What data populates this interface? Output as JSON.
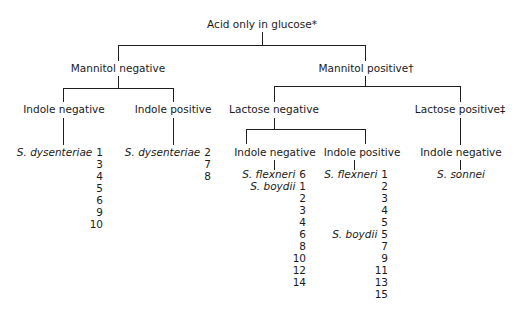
{
  "root": "Acid only in glucose*",
  "level1": {
    "left": "Mannitol negative",
    "right": "Mannitol positive†"
  },
  "level2": {
    "mn_left": "Indole negative",
    "mn_right": "Indole positive",
    "mp_left": "Lactose negative",
    "mp_right": "Lactose positive‡"
  },
  "level3": {
    "ln_left": "Indole negative",
    "ln_right": "Indole positive",
    "lp": "Indole negative"
  },
  "leaves": {
    "mn_indole_neg": [
      {
        "species": "S. dysenteriae",
        "num": "1"
      },
      {
        "species": "",
        "num": "3"
      },
      {
        "species": "",
        "num": "4"
      },
      {
        "species": "",
        "num": "5"
      },
      {
        "species": "",
        "num": "6"
      },
      {
        "species": "",
        "num": "9"
      },
      {
        "species": "",
        "num": "10"
      }
    ],
    "mn_indole_pos": [
      {
        "species": "S. dysenteriae",
        "num": "2"
      },
      {
        "species": "",
        "num": "7"
      },
      {
        "species": "",
        "num": "8"
      }
    ],
    "ln_indole_neg": [
      {
        "species": "S. flexneri",
        "num": "6"
      },
      {
        "species": "S. boydii",
        "num": "1"
      },
      {
        "species": "",
        "num": "2"
      },
      {
        "species": "",
        "num": "3"
      },
      {
        "species": "",
        "num": "4"
      },
      {
        "species": "",
        "num": "6"
      },
      {
        "species": "",
        "num": "8"
      },
      {
        "species": "",
        "num": "10"
      },
      {
        "species": "",
        "num": "12"
      },
      {
        "species": "",
        "num": "14"
      }
    ],
    "ln_indole_pos": [
      {
        "species": "S. flexneri",
        "num": "1"
      },
      {
        "species": "",
        "num": "2"
      },
      {
        "species": "",
        "num": "3"
      },
      {
        "species": "",
        "num": "4"
      },
      {
        "species": "",
        "num": "5"
      },
      {
        "species": "S. boydii",
        "num": "5"
      },
      {
        "species": "",
        "num": "7"
      },
      {
        "species": "",
        "num": "9"
      },
      {
        "species": "",
        "num": "11"
      },
      {
        "species": "",
        "num": "13"
      },
      {
        "species": "",
        "num": "15"
      }
    ],
    "lp_indole_neg": "S. sonnei"
  }
}
